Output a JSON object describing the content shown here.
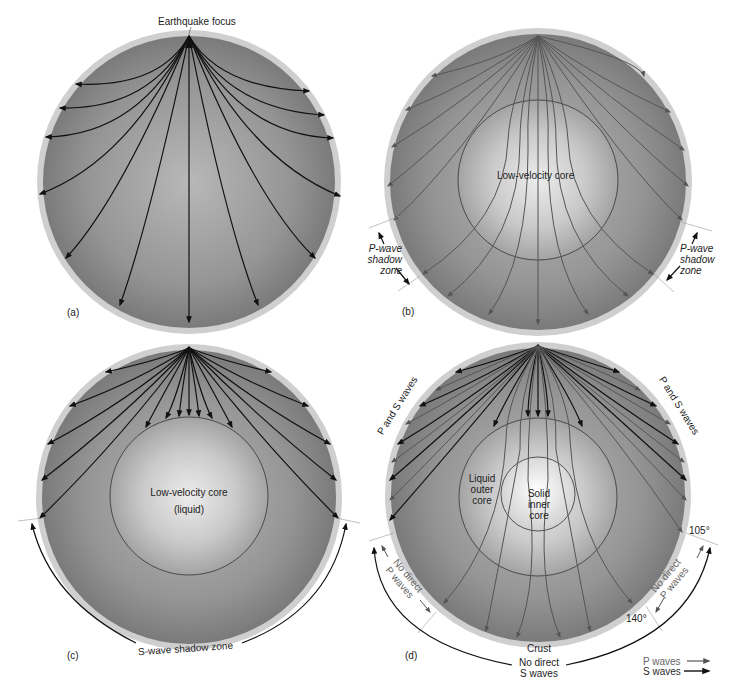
{
  "colors": {
    "crust": "#cfcfcf",
    "crust_inner": "#b9b9b9",
    "mantle_edge": "#7d7d7d",
    "mantle_center": "#b4b4b4",
    "core_center": "#e6e6e6",
    "core_edge": "#9a9a9a",
    "inner_core_center": "#fafafa",
    "s_wave": "#111111",
    "p_wave": "#555555",
    "text": "#222222",
    "guide_line": "#999999"
  },
  "panels": [
    {
      "id": "a",
      "label": "(a)",
      "title_label": "Earthquake focus",
      "center": [
        189,
        182
      ],
      "radius": 152
    },
    {
      "id": "b",
      "label": "(b)",
      "core_label": "Low-velocity core",
      "left_zone_label": [
        "P-wave",
        "shadow",
        "zone"
      ],
      "right_zone_label": [
        "P-wave",
        "shadow",
        "zone"
      ],
      "center": [
        538,
        182
      ],
      "radius": 154,
      "core_radius": 80
    },
    {
      "id": "c",
      "label": "(c)",
      "core_label": [
        "Low-velocity core",
        "(liquid)"
      ],
      "zone_label": "S-wave shadow zone",
      "center": [
        189,
        497
      ],
      "radius": 153,
      "core_radius": 79
    },
    {
      "id": "d",
      "label": "(d)",
      "outer_core_label": [
        "Liquid",
        "outer",
        "core"
      ],
      "inner_core_label": [
        "Solid",
        "inner",
        "core"
      ],
      "left_edge_label": "P and S waves",
      "right_edge_label": "P and S waves",
      "left_zone_label": [
        "No direct",
        "P waves"
      ],
      "right_zone_label": [
        "No direct",
        "P waves"
      ],
      "angle_105": "105°",
      "angle_140": "140°",
      "crust_label": "Crust",
      "bottom_label": [
        "No direct",
        "S waves"
      ],
      "center": [
        538,
        495
      ],
      "radius": 153,
      "core_radius": 79,
      "inner_core_radius": 37
    }
  ],
  "legend": {
    "p_waves": "P waves",
    "s_waves": "S waves"
  }
}
